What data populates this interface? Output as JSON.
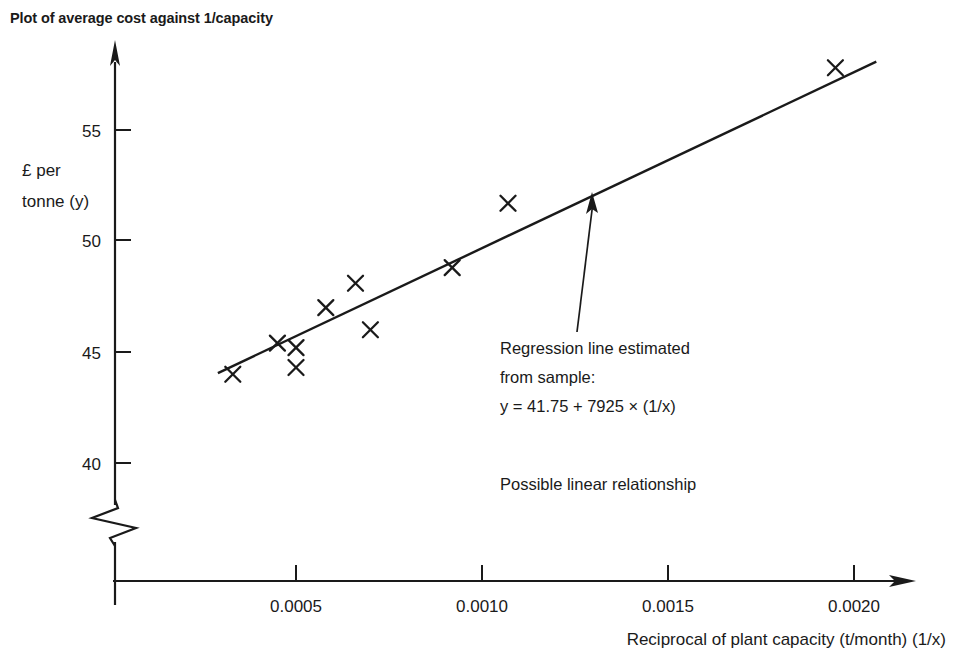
{
  "title": "Plot of average cost against 1/capacity",
  "chart_data": {
    "type": "scatter",
    "title": "Plot of average cost against 1/capacity",
    "xlabel": "Reciprocal of plant capacity (t/month) (1/x)",
    "ylabel": "£ per tonne (y)",
    "ylabel_line1": "£ per",
    "ylabel_line2": "tonne (y)",
    "xlim": [
      0.0,
      0.00215
    ],
    "ylim": [
      39.0,
      58.8
    ],
    "y_axis_break": true,
    "grid": false,
    "legend": null,
    "xticks": [
      0.0005,
      0.001,
      0.0015,
      0.002
    ],
    "xtick_labels": [
      "0.0005",
      "0.0010",
      "0.0015",
      "0.0020"
    ],
    "yticks": [
      40,
      45,
      50,
      55
    ],
    "ytick_labels": [
      "40",
      "45",
      "50",
      "55"
    ],
    "marker": "x",
    "points": [
      {
        "x": 0.00033,
        "y": 44.0
      },
      {
        "x": 0.00045,
        "y": 45.4
      },
      {
        "x": 0.0005,
        "y": 45.2
      },
      {
        "x": 0.0005,
        "y": 44.3
      },
      {
        "x": 0.00058,
        "y": 47.0
      },
      {
        "x": 0.00066,
        "y": 48.1
      },
      {
        "x": 0.0007,
        "y": 46.0
      },
      {
        "x": 0.00092,
        "y": 48.8
      },
      {
        "x": 0.00107,
        "y": 51.7
      },
      {
        "x": 0.00195,
        "y": 57.8
      }
    ],
    "regression": {
      "intercept": 41.75,
      "slope": 7925,
      "equation": "y = 41.75 + 7925 × (1/x)",
      "x_start": 0.00029,
      "x_end": 0.00206
    },
    "annotations": [
      {
        "name": "regression-callout",
        "lines": [
          "Regression line estimated",
          "from sample:",
          "y = 41.75 + 7925 × (1/x)"
        ]
      },
      {
        "name": "relationship-note",
        "lines": [
          "Possible linear relationship"
        ]
      }
    ]
  },
  "colors": {
    "ink": "#1a1a1a",
    "background": "#ffffff"
  }
}
